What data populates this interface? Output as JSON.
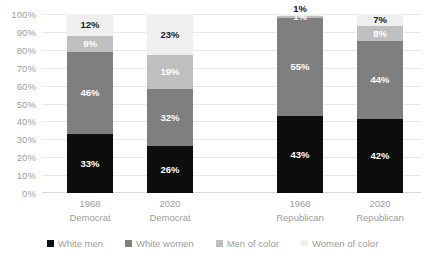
{
  "chart_data": {
    "type": "bar",
    "subtype": "stacked-bar-100",
    "title": "",
    "subtitle": "",
    "xlabel": "",
    "ylabel": "",
    "ylim": [
      0,
      100
    ],
    "grid": true,
    "legend_position": "bottom",
    "categories": [
      "1968 Democrat",
      "2020 Democrat",
      "1968 Republican",
      "2020 Republican"
    ],
    "category_lines": [
      {
        "year": "1968",
        "party": "Democrat"
      },
      {
        "year": "2020",
        "party": "Democrat"
      },
      {
        "year": "1968",
        "party": "Republican"
      },
      {
        "year": "2020",
        "party": "Republican"
      }
    ],
    "y_ticks": [
      "0%",
      "10%",
      "20%",
      "30%",
      "40%",
      "50%",
      "60%",
      "70%",
      "80%",
      "90%",
      "100%"
    ],
    "y_tick_values": [
      0,
      10,
      20,
      30,
      40,
      50,
      60,
      70,
      80,
      90,
      100
    ],
    "series": [
      {
        "name": "White men",
        "color": "#0d0d0d",
        "label_color": "#ffffff",
        "values": [
          33,
          26,
          43,
          42
        ],
        "labels": [
          "33%",
          "26%",
          "43%",
          "42%"
        ]
      },
      {
        "name": "White women",
        "color": "#7f7f7f",
        "label_color": "#ffffff",
        "values": [
          46,
          32,
          55,
          44
        ],
        "labels": [
          "46%",
          "32%",
          "55%",
          "44%"
        ]
      },
      {
        "name": "Men of color",
        "color": "#bfbfbf",
        "label_color": "#ffffff",
        "values": [
          9,
          19,
          1,
          8
        ],
        "labels": [
          "9%",
          "19%",
          "1%",
          "8%"
        ]
      },
      {
        "name": "Women of color",
        "color": "#efefef",
        "label_color": "#202020",
        "values": [
          12,
          23,
          1,
          7
        ],
        "labels": [
          "12%",
          "23%",
          "1%",
          "7%"
        ]
      }
    ]
  },
  "legend": {
    "items": [
      {
        "label": "White men",
        "color": "#0d0d0d"
      },
      {
        "label": "White women",
        "color": "#7f7f7f"
      },
      {
        "label": "Men of color",
        "color": "#bfbfbf"
      },
      {
        "label": "Women of color",
        "color": "#efefef"
      }
    ]
  }
}
